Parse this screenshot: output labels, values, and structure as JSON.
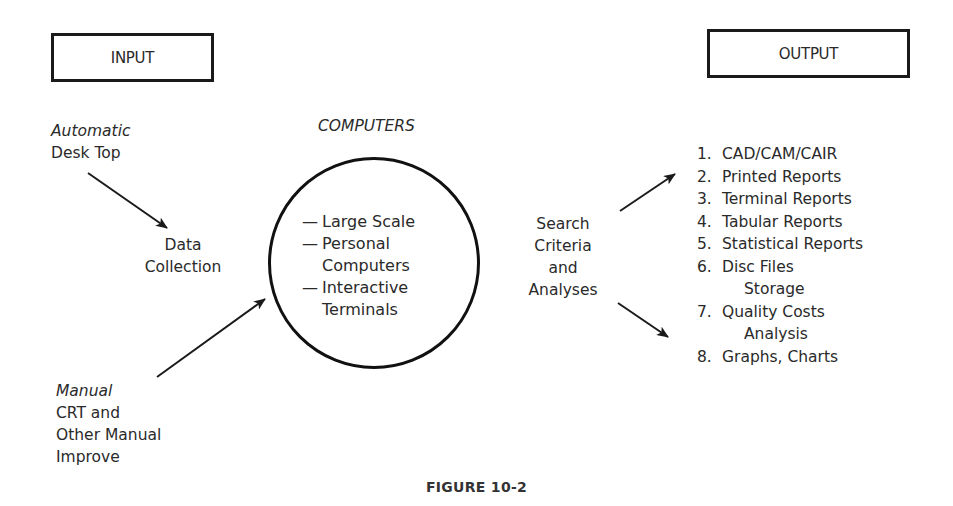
{
  "input_box": {
    "label": "INPUT"
  },
  "output_box": {
    "label": "OUTPUT"
  },
  "input_automatic": {
    "mode": "Automatic",
    "source": "Desk Top"
  },
  "data_collection": {
    "line1": "Data",
    "line2": "Collection"
  },
  "input_manual": {
    "mode": "Manual",
    "line1": "CRT and",
    "line2": "Other Manual",
    "line3": "Improve"
  },
  "computers": {
    "title": "COMPUTERS",
    "dash": "—",
    "items": [
      {
        "label": "Large Scale"
      },
      {
        "label": "Personal",
        "continuation": "Computers"
      },
      {
        "label": "Interactive",
        "continuation": "Terminals"
      }
    ]
  },
  "search": {
    "line1": "Search",
    "line2": "Criteria",
    "line3": "and",
    "line4": "Analyses"
  },
  "outputs": [
    {
      "num": "1.",
      "label": "CAD/CAM/CAIR"
    },
    {
      "num": "2.",
      "label": "Printed Reports"
    },
    {
      "num": "3.",
      "label": "Terminal Reports"
    },
    {
      "num": "4.",
      "label": "Tabular Reports"
    },
    {
      "num": "5.",
      "label": "Statistical Reports"
    },
    {
      "num": "6.",
      "label": "Disc Files",
      "continuation": "Storage"
    },
    {
      "num": "7.",
      "label": "Quality Costs",
      "continuation": "Analysis"
    },
    {
      "num": "8.",
      "label": "Graphs, Charts"
    }
  ],
  "caption": "FIGURE 10-2",
  "colors": {
    "ink": "#1a1a1a",
    "text": "#2a2a2a",
    "background": "#ffffff"
  }
}
